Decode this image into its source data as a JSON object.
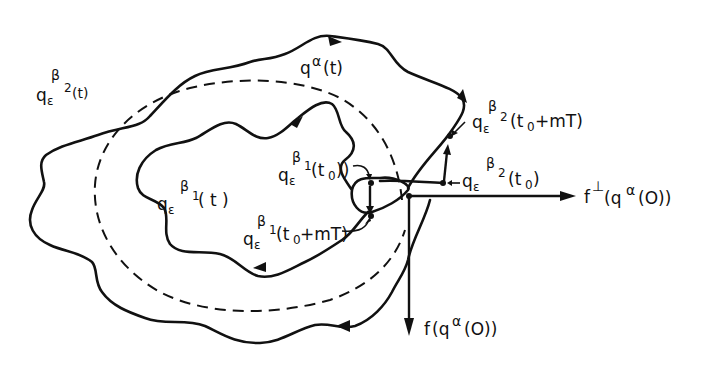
{
  "figure": {
    "curves": [
      {
        "id": "outer",
        "name": "q_epsilon^beta2(t)",
        "style": "solid"
      },
      {
        "id": "middle",
        "name": "q^alpha(t)",
        "style": "dashed"
      },
      {
        "id": "inner",
        "name": "q_epsilon^beta1(t)",
        "style": "solid"
      }
    ],
    "vectors": [
      {
        "id": "tangent",
        "label": "f(q^alpha(0))",
        "direction": "down"
      },
      {
        "id": "normal",
        "label": "f^perp(q^alpha(0))",
        "direction": "right"
      }
    ]
  },
  "labels": {
    "outer_curve": {
      "base": "q",
      "sub": "ε",
      "sup_sym": "β",
      "sup_sub": "2",
      "arg": "(t)"
    },
    "dashed_curve": {
      "base": "q",
      "sup": "α",
      "arg": "(t)"
    },
    "inner_curve": {
      "base": "q",
      "sub": "ε",
      "sup_sym": "β",
      "sup_sub": "1",
      "arg": "( t )"
    },
    "beta1_t0": {
      "base": "q",
      "sub": "ε",
      "sup_sym": "β",
      "sup_sub": "1",
      "arg": "(t",
      "arg_sub": "0",
      "arg_end": "))"
    },
    "beta1_t0_mT": {
      "base": "q",
      "sub": "ε",
      "sup_sym": "β",
      "sup_sub": "1",
      "arg": "(t",
      "arg_sub": "0",
      "arg_end": "+mT)"
    },
    "beta2_t0_mT": {
      "base": "q",
      "sub": "ε",
      "sup_sym": "β",
      "sup_sub": "2",
      "arg": "(t",
      "arg_sub": "0",
      "arg_end": "+mT)"
    },
    "beta2_t0": {
      "base": "q",
      "sub": "ε",
      "sup_sym": "β",
      "sup_sub": "2",
      "arg": "(t",
      "arg_sub": "0",
      "arg_end": ")"
    },
    "normal_vector": {
      "base": "f",
      "sup": "⊥",
      "arg": "(q",
      "arg_sup": "α",
      "arg_end": "(O))"
    },
    "tangent_vector": {
      "base": "f",
      "arg": "(q",
      "arg_sup": "α",
      "arg_end": "(O))"
    }
  },
  "colors": {
    "ink": "#111111",
    "background": "#ffffff"
  }
}
